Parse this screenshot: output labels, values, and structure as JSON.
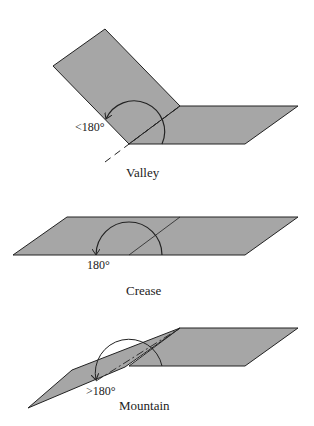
{
  "diagrams": [
    {
      "name": "Valley",
      "angle_label": "<180°",
      "caption": "Valley"
    },
    {
      "name": "Crease",
      "angle_label": "180°",
      "caption": "Crease"
    },
    {
      "name": "Mountain",
      "angle_label": ">180°",
      "caption": "Mountain"
    }
  ],
  "colors": {
    "panel_fill": "#a6a6a6",
    "stroke": "#222222"
  }
}
